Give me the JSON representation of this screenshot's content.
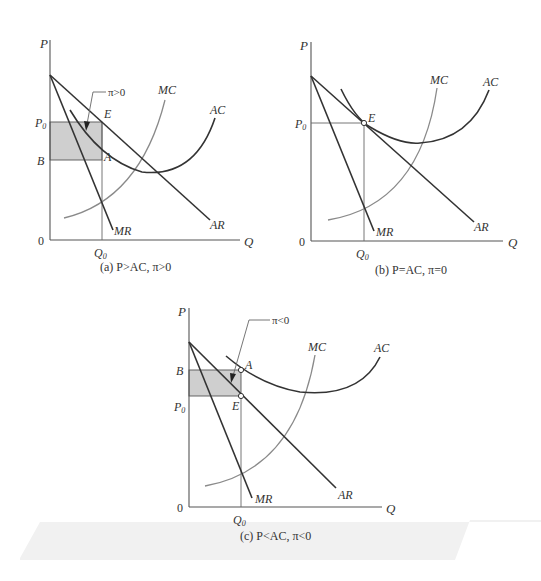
{
  "figure": {
    "panels": [
      {
        "id": "a",
        "caption": "(a) P>AC, π>0",
        "axis_y": "P",
        "axis_x": "Q",
        "origin": "0",
        "labels": {
          "p0": "P",
          "p0_sub": "0",
          "b": "B",
          "q0": "Q",
          "q0_sub": "0",
          "e": "E",
          "a": "A",
          "mc": "MC",
          "ac": "AC",
          "ar": "AR",
          "mr": "MR"
        },
        "callout": "π>0",
        "relation": "P>AC",
        "profit": "π>0"
      },
      {
        "id": "b",
        "caption": "(b) P=AC, π=0",
        "axis_y": "P",
        "axis_x": "Q",
        "origin": "0",
        "labels": {
          "p0": "P",
          "p0_sub": "0",
          "q0": "Q",
          "q0_sub": "0",
          "e": "E",
          "mc": "MC",
          "ac": "AC",
          "ar": "AR",
          "mr": "MR"
        },
        "relation": "P=AC",
        "profit": "π=0"
      },
      {
        "id": "c",
        "caption": "(c) P<AC, π<0",
        "axis_y": "P",
        "axis_x": "Q",
        "origin": "0",
        "labels": {
          "p0": "P",
          "p0_sub": "0",
          "b": "B",
          "q0": "Q",
          "q0_sub": "0",
          "e": "E",
          "a": "A",
          "mc": "MC",
          "ac": "AC",
          "ar": "AR",
          "mr": "MR"
        },
        "callout": "π<0",
        "relation": "P<AC",
        "profit": "π<0"
      }
    ],
    "colors": {
      "curve_dark": "#333333",
      "mc_curve": "#8a8a8a",
      "shaded_area": "#cfcfcf",
      "background": "#ffffff"
    }
  }
}
